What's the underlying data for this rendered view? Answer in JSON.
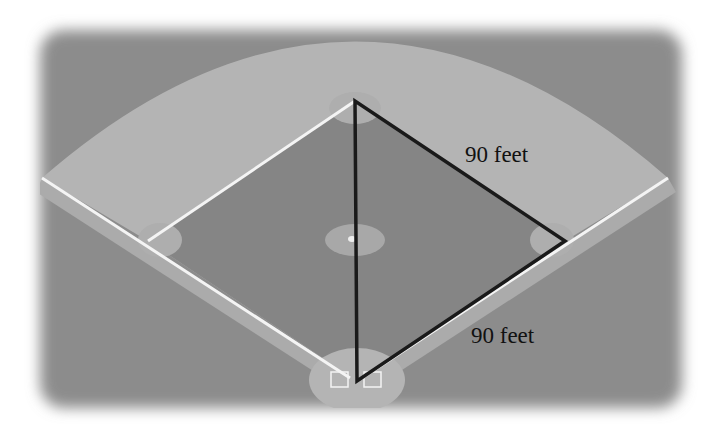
{
  "diagram": {
    "labels": {
      "second_to_first": "90 feet",
      "first_to_home": "90 feet"
    },
    "points": {
      "home_plate": [
        357,
        381
      ],
      "first_base": [
        565,
        241
      ],
      "second_base": [
        355,
        101
      ],
      "third_base": [
        148,
        241
      ],
      "pitchers_mound": [
        355,
        240
      ]
    },
    "triangle": [
      "home_plate",
      "second_base",
      "first_base"
    ],
    "colors": {
      "background": "#ffffff",
      "grass": "#8c8c8c",
      "infield_grass": "#858585",
      "outfield_dirt": "#b4b4b4",
      "base_dirt": "#b0b0b0",
      "chalk_line": "#f4f4f4",
      "triangle_stroke": "#1a1a1a",
      "text": "#111111"
    }
  }
}
